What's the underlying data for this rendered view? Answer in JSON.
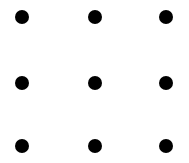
{
  "canvas": {
    "width": 189,
    "height": 163,
    "background_color": "#ffffff",
    "title": "Dot Grid"
  },
  "grid": {
    "rows": 3,
    "columns": 3,
    "dot_count": 9,
    "dot_color": "#000000",
    "dot_diameter": 14,
    "column_centers_x": [
      22,
      95,
      166
    ],
    "row_centers_y": [
      17,
      83,
      146
    ],
    "dots": [
      {
        "id": "dot-r1-c1",
        "row": 1,
        "column": 1,
        "cx": 22,
        "cy": 17,
        "d": 14,
        "color": "#000000"
      },
      {
        "id": "dot-r1-c2",
        "row": 1,
        "column": 2,
        "cx": 95,
        "cy": 17,
        "d": 14,
        "color": "#000000"
      },
      {
        "id": "dot-r1-c3",
        "row": 1,
        "column": 3,
        "cx": 166,
        "cy": 17,
        "d": 14,
        "color": "#000000"
      },
      {
        "id": "dot-r2-c1",
        "row": 2,
        "column": 1,
        "cx": 22,
        "cy": 83,
        "d": 14,
        "color": "#000000"
      },
      {
        "id": "dot-r2-c2",
        "row": 2,
        "column": 2,
        "cx": 95,
        "cy": 83,
        "d": 14,
        "color": "#000000"
      },
      {
        "id": "dot-r2-c3",
        "row": 2,
        "column": 3,
        "cx": 166,
        "cy": 83,
        "d": 14,
        "color": "#000000"
      },
      {
        "id": "dot-r3-c1",
        "row": 3,
        "column": 1,
        "cx": 22,
        "cy": 146,
        "d": 14,
        "color": "#000000"
      },
      {
        "id": "dot-r3-c2",
        "row": 3,
        "column": 2,
        "cx": 95,
        "cy": 146,
        "d": 14,
        "color": "#000000"
      },
      {
        "id": "dot-r3-c3",
        "row": 3,
        "column": 3,
        "cx": 166,
        "cy": 146,
        "d": 14,
        "color": "#000000"
      }
    ]
  }
}
